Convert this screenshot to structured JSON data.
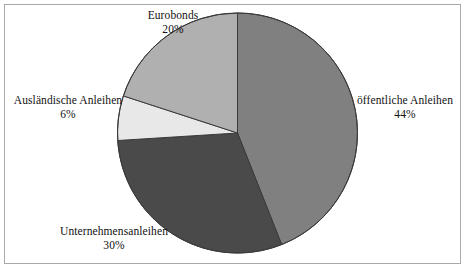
{
  "figure": {
    "background_color": "#ffffff",
    "frame_color": "#a9a9a9",
    "title": ""
  },
  "chart_data": {
    "type": "pie",
    "title": "",
    "xlabel": "",
    "ylabel": "",
    "legend_position": "none",
    "grid": false,
    "start_angle_deg": 0,
    "direction": "clockwise",
    "units": "percent",
    "total": 100,
    "categories": [
      "öffentliche Anleihen",
      "Unternehmensanleihen",
      "Ausländische Anleihen",
      "Eurobonds"
    ],
    "values": [
      44,
      30,
      6,
      20
    ],
    "value_labels": [
      "44%",
      "30%",
      "6%",
      "20%"
    ],
    "colors": [
      "#808080",
      "#4a4a4a",
      "#e8e8e8",
      "#b0b0b0"
    ],
    "slice_border_color": "#3a3a3a",
    "slices": [
      {
        "name": "öffentliche Anleihen",
        "value": 44,
        "value_label": "44%",
        "color": "#808080",
        "start_angle_deg": 0,
        "end_angle_deg": 158.4,
        "label_position": "right"
      },
      {
        "name": "Unternehmensanleihen",
        "value": 30,
        "value_label": "30%",
        "color": "#4a4a4a",
        "start_angle_deg": 158.4,
        "end_angle_deg": 266.4,
        "label_position": "bottom-left"
      },
      {
        "name": "Ausländische Anleihen",
        "value": 6,
        "value_label": "6%",
        "color": "#e8e8e8",
        "start_angle_deg": 266.4,
        "end_angle_deg": 288.0,
        "label_position": "left"
      },
      {
        "name": "Eurobonds",
        "value": 20,
        "value_label": "20%",
        "color": "#b0b0b0",
        "start_angle_deg": 288.0,
        "end_angle_deg": 360.0,
        "label_position": "top-left"
      }
    ]
  },
  "labels": {
    "eurobonds": {
      "name": "Eurobonds",
      "value": "20%"
    },
    "auslaendische": {
      "name": "Ausländische Anleihen",
      "value": "6%"
    },
    "oeffentliche": {
      "name": "öffentliche Anleihen",
      "value": "44%"
    },
    "unternehmens": {
      "name": "Unternehmensanleihen",
      "value": "30%"
    }
  }
}
